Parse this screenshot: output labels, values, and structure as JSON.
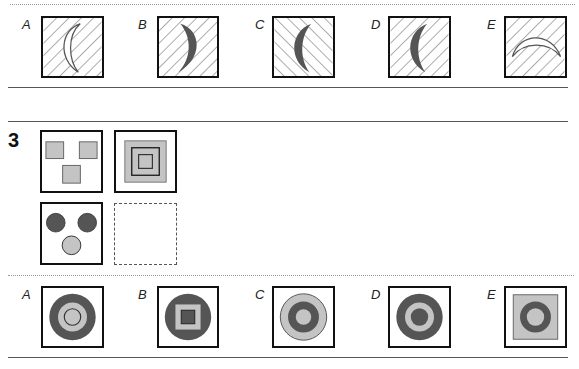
{
  "colors": {
    "dark": "#555555",
    "light": "#c4c4c4",
    "outline": "#111111",
    "hatch": "#555555"
  },
  "section_prev": {
    "options": [
      {
        "label": "A",
        "hatch": "forward",
        "shape": "crescent-outline-left"
      },
      {
        "label": "B",
        "hatch": "forward",
        "shape": "crescent-filled-right"
      },
      {
        "label": "C",
        "hatch": "backward",
        "shape": "crescent-filled-left"
      },
      {
        "label": "D",
        "hatch": "forward",
        "shape": "crescent-filled-left"
      },
      {
        "label": "E",
        "hatch": "forward",
        "shape": "crescent-outline-up"
      }
    ]
  },
  "question": {
    "number": "3",
    "grid": [
      {
        "position": "top-left",
        "content": "three light grey squares"
      },
      {
        "position": "top-right",
        "content": "nested squares: light grey with dark outlines"
      },
      {
        "position": "bottom-left",
        "content": "two dark circles, one light circle"
      },
      {
        "position": "bottom-right",
        "content": "empty (answer)"
      }
    ],
    "options": [
      {
        "label": "A",
        "content": "dark ring, light circle, outlined inner circle"
      },
      {
        "label": "B",
        "content": "dark circle, light square, dark inner square"
      },
      {
        "label": "C",
        "content": "light ring, dark ring, light centre"
      },
      {
        "label": "D",
        "content": "dark ring, light ring, dark centre"
      },
      {
        "label": "E",
        "content": "light square, dark ring, light centre"
      }
    ]
  }
}
